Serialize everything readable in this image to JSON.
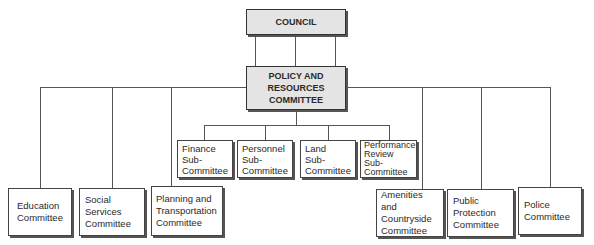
{
  "diagram": {
    "type": "organisation-chart",
    "council": {
      "label": "COUNCIL"
    },
    "policy": {
      "lines": [
        "POLICY AND",
        "RESOURCES",
        "COMMITTEE"
      ]
    },
    "sub_committees": [
      {
        "lines": [
          "Finance",
          "Sub-",
          "Committee"
        ]
      },
      {
        "lines": [
          "Personnel",
          "Sub-",
          "Committee"
        ]
      },
      {
        "lines": [
          "Land",
          "Sub-",
          "Committee"
        ]
      },
      {
        "lines": [
          "Performance",
          "Review",
          "Sub-",
          "Committee"
        ]
      }
    ],
    "committees": [
      {
        "lines": [
          "Education",
          "Committee"
        ]
      },
      {
        "lines": [
          "Social",
          "Services",
          "Committee"
        ]
      },
      {
        "lines": [
          "Planning and",
          "Transportation",
          "Committee"
        ]
      },
      {
        "lines": [
          "Amenities and",
          "Countryside",
          "Committee"
        ]
      },
      {
        "lines": [
          "Public",
          "Protection",
          "Committee"
        ]
      },
      {
        "lines": [
          "Police",
          "Committee"
        ]
      }
    ]
  }
}
